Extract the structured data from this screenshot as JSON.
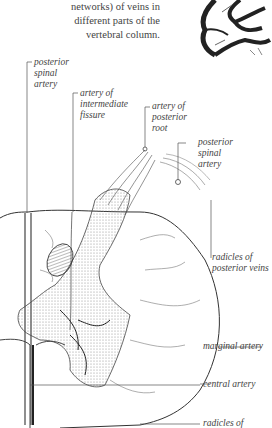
{
  "caption": {
    "lines": [
      "networks) of veins in",
      "different parts of the",
      "vertebral column."
    ]
  },
  "figure": {
    "labels": {
      "posterior_spinal_artery_left": [
        "posterior",
        "spinal",
        "artery"
      ],
      "artery_intermediate_fissure": [
        "artery of",
        "intermediate",
        "fissure"
      ],
      "artery_posterior_root": [
        "artery of",
        "posterior",
        "root"
      ],
      "posterior_spinal_artery_right": [
        "posterior",
        "spinal",
        "artery"
      ],
      "radicles_posterior_veins": [
        "radicles of",
        "posterior veins"
      ],
      "marginal_artery": "marginal artery",
      "central_artery": "central artery",
      "radicles_bottom": "radicles of"
    }
  }
}
